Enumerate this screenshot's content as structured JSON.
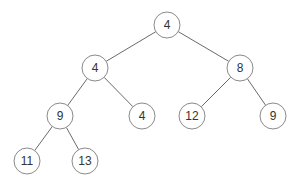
{
  "diagram": {
    "type": "binary-tree",
    "node_radius": 13,
    "colors": {
      "edge": "#6a6a6a",
      "node_stroke": "#8a8a8a",
      "node_fill": "#ffffff",
      "label": "#333333"
    },
    "nodes": [
      {
        "id": "n0",
        "label": "4",
        "x": 167,
        "y": 25
      },
      {
        "id": "n1",
        "label": "4",
        "x": 95,
        "y": 68
      },
      {
        "id": "n2",
        "label": "8",
        "x": 240,
        "y": 68
      },
      {
        "id": "n3",
        "label": "9",
        "x": 60,
        "y": 116
      },
      {
        "id": "n4",
        "label": "4",
        "x": 142,
        "y": 116
      },
      {
        "id": "n5",
        "label": "12",
        "x": 192,
        "y": 116
      },
      {
        "id": "n6",
        "label": "9",
        "x": 273,
        "y": 116
      },
      {
        "id": "n7",
        "label": "11",
        "x": 27,
        "y": 161
      },
      {
        "id": "n8",
        "label": "13",
        "x": 85,
        "y": 161
      }
    ],
    "edges": [
      [
        "n0",
        "n1"
      ],
      [
        "n0",
        "n2"
      ],
      [
        "n1",
        "n3"
      ],
      [
        "n1",
        "n4"
      ],
      [
        "n2",
        "n5"
      ],
      [
        "n2",
        "n6"
      ],
      [
        "n3",
        "n7"
      ],
      [
        "n3",
        "n8"
      ]
    ]
  }
}
